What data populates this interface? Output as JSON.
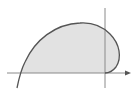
{
  "figure": {
    "description": "Shaded region bounded by a closed curve crossing the axes",
    "colors": {
      "background": "#ffffff",
      "axis": "#8a8a8a",
      "curve": "#555555",
      "fill": "#e2e2e2"
    },
    "axes": {
      "x_axis": {
        "y": 73,
        "x_start": 7,
        "x_end": 131,
        "arrow": true
      },
      "y_axis": {
        "x": 105,
        "y_start": 8,
        "y_end": 88,
        "arrow": false
      }
    },
    "curve_path": "M17,88 C19,78 21,70 25,62 C35,40 55,24 80,23 C95,22 104,28 110,34 C120,44 122,58 116,67 C112,72 108,73 105,73",
    "region_path": "M20,73 C21,70 22,66 25,62 C35,40 55,24 80,23 C95,22 104,28 110,34 C120,44 122,58 116,67 C112,72 108,73 105,73 Z"
  }
}
